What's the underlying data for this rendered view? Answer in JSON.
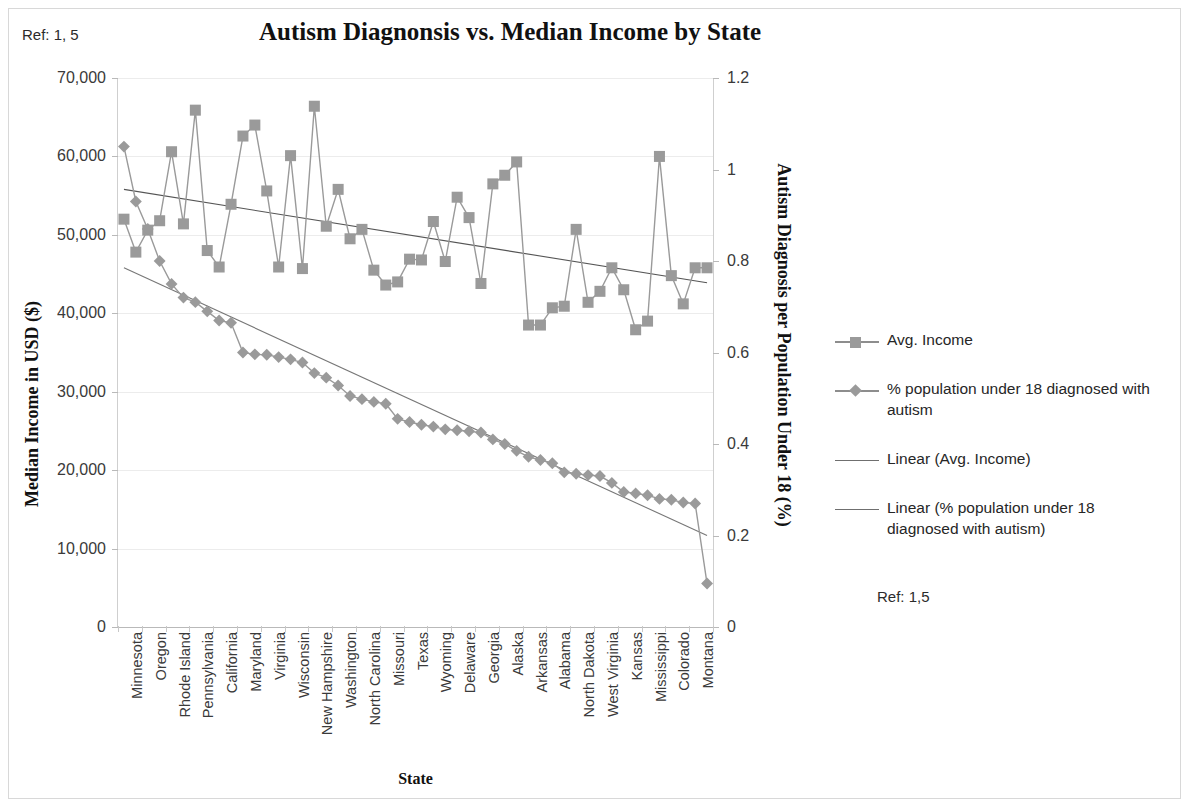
{
  "page": {
    "ref_top": "Ref: 1, 5",
    "ref_legend": "Ref: 1,5"
  },
  "chart_data": {
    "type": "line",
    "title": "Autism Diagnonsis vs. Median Income by State",
    "xlabel": "State",
    "ylabel": "Median Income in USD ($)",
    "ylabel_secondary": "Autism Diagnosis per Population Under 18 (%)",
    "grid": true,
    "legend_position": "right",
    "ylim": [
      0,
      70000
    ],
    "ylim_secondary": [
      0,
      1.2
    ],
    "yticks": [
      "0",
      "10,000",
      "20,000",
      "30,000",
      "40,000",
      "50,000",
      "60,000",
      "70,000"
    ],
    "ytick_values": [
      0,
      10000,
      20000,
      30000,
      40000,
      50000,
      60000,
      70000
    ],
    "yticks_secondary": [
      "0",
      "0.2",
      "0.4",
      "0.6",
      "0.8",
      "1",
      "1.2"
    ],
    "ytick_values_secondary": [
      0,
      0.2,
      0.4,
      0.6,
      0.8,
      1,
      1.2
    ],
    "categories": [
      "Minnesota",
      "Oklahoma",
      "Oregon",
      "New Jersey",
      "Rhode Island",
      "Connecticut",
      "Pennsylvania",
      "Utah",
      "California",
      "Indiana",
      "Maryland",
      "Massachusetts",
      "Virginia",
      "Nevada",
      "Wisconsin",
      "Illinois",
      "New Hampshire",
      "Ohio",
      "Washington",
      "Florida",
      "North Carolina",
      "Iowa",
      "Missouri",
      "Nebraska",
      "Texas",
      "New York",
      "Wyoming",
      "Maine",
      "Delaware",
      "Michigan",
      "Georgia",
      "Tennessee",
      "Alaska",
      "Hawaii",
      "Arkansas",
      "South Carolina",
      "Alabama",
      "Vermont",
      "North Dakota",
      "Idaho",
      "West Virginia",
      "Arizona",
      "Kansas",
      "Louisiana",
      "Mississippi",
      "Kentucky",
      "Colorado",
      "New Mexico",
      "Montana",
      "South Dakota"
    ],
    "xtick_labels_shown": [
      "Minnesota",
      "Oregon",
      "Rhode Island",
      "Pennsylvania",
      "California",
      "Maryland",
      "Virginia",
      "Wisconsin",
      "New Hampshire",
      "Washington",
      "North Carolina",
      "Missouri",
      "Texas",
      "Wyoming",
      "Delaware",
      "Georgia",
      "Alaska",
      "Arkansas",
      "Alabama",
      "North Dakota",
      "West Virginia",
      "Kansas",
      "Mississippi",
      "Colorado",
      "Montana"
    ],
    "series": [
      {
        "name": "Avg. Income",
        "axis": "left",
        "marker": "square",
        "color": "#9a9a9a",
        "values": [
          52000,
          47800,
          50600,
          51800,
          60600,
          51400,
          65900,
          48000,
          45900,
          53900,
          62600,
          64000,
          55600,
          45900,
          60100,
          45700,
          66400,
          51100,
          55800,
          49500,
          50700,
          45500,
          43600,
          44000,
          46900,
          46800,
          51700,
          46600,
          54800,
          52200,
          43800,
          56500,
          57600,
          59300,
          38500,
          38500,
          40700,
          40900,
          50700,
          41400,
          42800,
          45800,
          43000,
          37900,
          39000,
          60000,
          44800,
          41200,
          45800,
          45800
        ]
      },
      {
        "name": "% population under 18 diagnosed with autism",
        "axis": "right",
        "marker": "diamond",
        "color": "#9a9a9a",
        "values": [
          1.05,
          0.93,
          0.87,
          0.8,
          0.75,
          0.72,
          0.71,
          0.69,
          0.67,
          0.665,
          0.6,
          0.596,
          0.595,
          0.59,
          0.585,
          0.578,
          0.555,
          0.545,
          0.528,
          0.505,
          0.498,
          0.492,
          0.488,
          0.455,
          0.448,
          0.442,
          0.438,
          0.432,
          0.43,
          0.428,
          0.425,
          0.41,
          0.4,
          0.385,
          0.372,
          0.365,
          0.358,
          0.338,
          0.335,
          0.332,
          0.33,
          0.315,
          0.295,
          0.292,
          0.288,
          0.28,
          0.278,
          0.272,
          0.27,
          0.095
        ]
      }
    ],
    "trendlines": [
      {
        "name": "Linear (Avg. Income)",
        "axis": "left",
        "start_value": 55800,
        "end_value": 43900,
        "color": "#555555"
      },
      {
        "name": "Linear (% population under 18 diagnosed with autism)",
        "axis": "right",
        "start_value": 0.785,
        "end_value": 0.2,
        "color": "#777777"
      }
    ],
    "legend": [
      {
        "label": "Avg. Income",
        "key": "square-line"
      },
      {
        "label": "% population under 18 diagnosed with autism",
        "key": "diamond-line"
      },
      {
        "label": "Linear (Avg. Income)",
        "key": "line"
      },
      {
        "label": "Linear (% population under 18 diagnosed with autism)",
        "key": "line"
      }
    ]
  }
}
